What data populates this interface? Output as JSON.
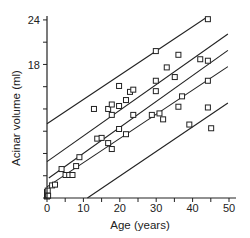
{
  "chart_data": {
    "type": "scatter",
    "title": "",
    "xlabel": "Age (years)",
    "ylabel": "Acinar volume (ml)",
    "xlim": [
      0,
      50
    ],
    "ylim": [
      0,
      24
    ],
    "x_ticks": [
      0,
      10,
      20,
      30,
      40,
      50
    ],
    "x_minor_ticks": [
      5,
      15,
      25,
      35,
      45
    ],
    "y_ticks_labeled": [
      18,
      24
    ],
    "y_ticks_all": [
      0,
      3,
      6,
      9,
      12,
      15,
      18,
      21,
      24
    ],
    "grid": false,
    "legend": null,
    "marker": "open-square",
    "series": [
      {
        "name": "observations",
        "points": [
          [
            0,
            0.2
          ],
          [
            0,
            0.5
          ],
          [
            0,
            0.8
          ],
          [
            0.2,
            1.0
          ],
          [
            0.3,
            0.3
          ],
          [
            1.4,
            1.7
          ],
          [
            2.2,
            1.8
          ],
          [
            4.0,
            3.9
          ],
          [
            5.1,
            3.1
          ],
          [
            6.1,
            3.1
          ],
          [
            7.0,
            3.1
          ],
          [
            8.0,
            4.3
          ],
          [
            8.9,
            5.5
          ],
          [
            12.9,
            12.0
          ],
          [
            13.8,
            8.0
          ],
          [
            15.0,
            8.1
          ],
          [
            16.8,
            12.0
          ],
          [
            16.8,
            7.4
          ],
          [
            17.8,
            12.6
          ],
          [
            17.8,
            11.2
          ],
          [
            17.8,
            6.6
          ],
          [
            19.8,
            15.1
          ],
          [
            19.8,
            12.4
          ],
          [
            19.8,
            9.3
          ],
          [
            21.7,
            13.2
          ],
          [
            21.7,
            8.6
          ],
          [
            22.8,
            14.3
          ],
          [
            23.7,
            14.6
          ],
          [
            23.7,
            11.2
          ],
          [
            28.8,
            11.2
          ],
          [
            29.9,
            19.8
          ],
          [
            29.9,
            15.8
          ],
          [
            29.9,
            14.4
          ],
          [
            30.9,
            11.4
          ],
          [
            31.9,
            10.6
          ],
          [
            32.9,
            17.6
          ],
          [
            35.1,
            16.3
          ],
          [
            36.1,
            19.3
          ],
          [
            36.1,
            12.3
          ],
          [
            37.1,
            13.7
          ],
          [
            39.1,
            9.9
          ],
          [
            42.1,
            18.7
          ],
          [
            44.2,
            24.1
          ],
          [
            44.2,
            18.5
          ],
          [
            44.2,
            15.8
          ],
          [
            44.2,
            12.2
          ],
          [
            45.1,
            9.4
          ]
        ]
      }
    ],
    "lines": [
      {
        "name": "upper-prediction-limit",
        "x": [
          0,
          44
        ],
        "y": [
          10.0,
          24.4
        ]
      },
      {
        "name": "upper-confidence-limit",
        "x": [
          0,
          49.7
        ],
        "y": [
          4.9,
          22.1
        ]
      },
      {
        "name": "regression-line",
        "x": [
          0.5,
          49.7
        ],
        "y": [
          2.7,
          19.9
        ]
      },
      {
        "name": "lower-confidence-limit",
        "x": [
          0,
          49.7
        ],
        "y": [
          1.5,
          17.7
        ]
      },
      {
        "name": "lower-prediction-limit",
        "x": [
          11.1,
          49.7
        ],
        "y": [
          0,
          12.8
        ]
      }
    ]
  },
  "axes": {
    "x_label": "Age (years)",
    "y_label": "Acinar volume (ml)",
    "x_tick_labels": [
      "0",
      "10",
      "20",
      "30",
      "40",
      "50"
    ],
    "y_tick_labels": [
      "18",
      "24"
    ]
  }
}
